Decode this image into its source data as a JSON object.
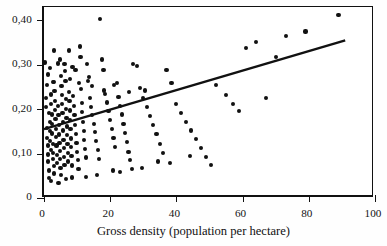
{
  "chart_data": {
    "type": "scatter",
    "title": "",
    "xlabel": "Gross density (population per hectare)",
    "ylabel": "",
    "xlim": [
      0,
      100
    ],
    "ylim": [
      0,
      0.43
    ],
    "grid": false,
    "legend": null,
    "decimal_separator": ",",
    "xticks": [
      0,
      20,
      40,
      60,
      80,
      100
    ],
    "xticklabels": [
      "0",
      "20",
      "40",
      "60",
      "80",
      "100"
    ],
    "yticks": [
      0,
      0.1,
      0.2,
      0.3,
      0.4
    ],
    "yticklabels": [
      "0",
      "0,10",
      "0,20",
      "0,30",
      "0,40"
    ],
    "series": [
      {
        "name": "cities",
        "marker": "filled-circle",
        "color": "#111111",
        "points": [
          [
            0.6,
            0.225
          ],
          [
            0.7,
            0.205
          ],
          [
            0.8,
            0.255
          ],
          [
            0.9,
            0.158
          ],
          [
            1.0,
            0.135
          ],
          [
            1.1,
            0.118
          ],
          [
            1.2,
            0.098
          ],
          [
            1.3,
            0.082
          ],
          [
            1.4,
            0.062
          ],
          [
            1.5,
            0.045
          ],
          [
            1.6,
            0.192
          ],
          [
            1.7,
            0.172
          ],
          [
            1.8,
            0.151
          ],
          [
            1.9,
            0.128
          ],
          [
            2.0,
            0.108
          ],
          [
            2.1,
            0.233
          ],
          [
            2.2,
            0.212
          ],
          [
            2.3,
            0.188
          ],
          [
            2.4,
            0.166
          ],
          [
            2.5,
            0.145
          ],
          [
            2.6,
            0.122
          ],
          [
            2.7,
            0.101
          ],
          [
            2.8,
            0.088
          ],
          [
            2.9,
            0.072
          ],
          [
            3.0,
            0.055
          ],
          [
            3.1,
            0.262
          ],
          [
            3.2,
            0.241
          ],
          [
            3.3,
            0.219
          ],
          [
            3.4,
            0.198
          ],
          [
            3.5,
            0.177
          ],
          [
            3.6,
            0.156
          ],
          [
            3.7,
            0.138
          ],
          [
            3.8,
            0.118
          ],
          [
            3.9,
            0.097
          ],
          [
            4.0,
            0.079
          ],
          [
            4.2,
            0.303
          ],
          [
            4.3,
            0.208
          ],
          [
            4.4,
            0.186
          ],
          [
            4.5,
            0.164
          ],
          [
            4.6,
            0.143
          ],
          [
            4.7,
            0.124
          ],
          [
            4.8,
            0.106
          ],
          [
            4.9,
            0.088
          ],
          [
            5.0,
            0.068
          ],
          [
            5.1,
            0.052
          ],
          [
            5.3,
            0.252
          ],
          [
            5.4,
            0.231
          ],
          [
            5.5,
            0.211
          ],
          [
            5.6,
            0.192
          ],
          [
            5.7,
            0.172
          ],
          [
            5.8,
            0.152
          ],
          [
            5.9,
            0.131
          ],
          [
            6.0,
            0.112
          ],
          [
            6.1,
            0.093
          ],
          [
            6.2,
            0.075
          ],
          [
            6.4,
            0.286
          ],
          [
            6.5,
            0.264
          ],
          [
            6.6,
            0.223
          ],
          [
            6.7,
            0.201
          ],
          [
            6.8,
            0.181
          ],
          [
            6.9,
            0.161
          ],
          [
            7.0,
            0.142
          ],
          [
            7.1,
            0.122
          ],
          [
            7.2,
            0.101
          ],
          [
            7.3,
            0.082
          ],
          [
            7.5,
            0.332
          ],
          [
            7.6,
            0.239
          ],
          [
            7.7,
            0.218
          ],
          [
            7.8,
            0.197
          ],
          [
            7.9,
            0.176
          ],
          [
            8.0,
            0.155
          ],
          [
            8.1,
            0.134
          ],
          [
            8.2,
            0.115
          ],
          [
            8.3,
            0.095
          ],
          [
            8.4,
            0.073
          ],
          [
            8.6,
            0.295
          ],
          [
            8.8,
            0.229
          ],
          [
            9.0,
            0.208
          ],
          [
            9.2,
            0.187
          ],
          [
            9.4,
            0.165
          ],
          [
            9.6,
            0.144
          ],
          [
            9.8,
            0.124
          ],
          [
            10.0,
            0.104
          ],
          [
            10.2,
            0.086
          ],
          [
            10.4,
            0.066
          ],
          [
            10.8,
            0.341
          ],
          [
            11.0,
            0.318
          ],
          [
            11.2,
            0.246
          ],
          [
            11.4,
            0.214
          ],
          [
            11.6,
            0.193
          ],
          [
            11.8,
            0.172
          ],
          [
            12.0,
            0.151
          ],
          [
            12.2,
            0.131
          ],
          [
            12.4,
            0.111
          ],
          [
            12.6,
            0.091
          ],
          [
            13.0,
            0.302
          ],
          [
            13.4,
            0.263
          ],
          [
            13.8,
            0.225
          ],
          [
            14.2,
            0.205
          ],
          [
            14.6,
            0.186
          ],
          [
            15.0,
            0.166
          ],
          [
            15.4,
            0.148
          ],
          [
            15.8,
            0.128
          ],
          [
            16.2,
            0.108
          ],
          [
            16.6,
            0.088
          ],
          [
            17.0,
            0.403
          ],
          [
            17.5,
            0.312
          ],
          [
            18.0,
            0.289
          ],
          [
            18.5,
            0.235
          ],
          [
            19.0,
            0.215
          ],
          [
            19.5,
            0.195
          ],
          [
            20.0,
            0.176
          ],
          [
            20.5,
            0.155
          ],
          [
            21.0,
            0.135
          ],
          [
            21.5,
            0.114
          ],
          [
            22.0,
            0.258
          ],
          [
            22.5,
            0.228
          ],
          [
            23.0,
            0.208
          ],
          [
            23.5,
            0.188
          ],
          [
            24.0,
            0.167
          ],
          [
            24.5,
            0.146
          ],
          [
            25.0,
            0.126
          ],
          [
            25.5,
            0.104
          ],
          [
            26.0,
            0.086
          ],
          [
            26.5,
            0.066
          ],
          [
            27.0,
            0.302
          ],
          [
            28.0,
            0.297
          ],
          [
            29.0,
            0.248
          ],
          [
            30.0,
            0.225
          ],
          [
            31.0,
            0.205
          ],
          [
            32.0,
            0.185
          ],
          [
            33.0,
            0.164
          ],
          [
            34.0,
            0.144
          ],
          [
            35.0,
            0.122
          ],
          [
            36.0,
            0.102
          ],
          [
            37.0,
            0.288
          ],
          [
            38.5,
            0.258
          ],
          [
            40.0,
            0.212
          ],
          [
            41.5,
            0.192
          ],
          [
            43.0,
            0.172
          ],
          [
            44.5,
            0.152
          ],
          [
            46.0,
            0.132
          ],
          [
            47.5,
            0.112
          ],
          [
            49.0,
            0.092
          ],
          [
            50.5,
            0.075
          ],
          [
            52.0,
            0.255
          ],
          [
            55.0,
            0.232
          ],
          [
            57.0,
            0.212
          ],
          [
            59.0,
            0.195
          ],
          [
            61.0,
            0.337
          ],
          [
            64.0,
            0.352
          ],
          [
            67.0,
            0.225
          ],
          [
            70.0,
            0.318
          ],
          [
            73.0,
            0.365
          ],
          [
            79.0,
            0.375
          ],
          [
            89.0,
            0.412
          ],
          [
            8.5,
            0.046
          ],
          [
            12.8,
            0.048
          ],
          [
            16.0,
            0.052
          ],
          [
            20.8,
            0.062
          ],
          [
            23.0,
            0.058
          ],
          [
            29.5,
            0.068
          ],
          [
            34.5,
            0.082
          ],
          [
            38.0,
            0.078
          ],
          [
            44.0,
            0.095
          ],
          [
            2.2,
            0.038
          ],
          [
            4.4,
            0.033
          ],
          [
            6.6,
            0.042
          ],
          [
            0.4,
            0.305
          ],
          [
            1.2,
            0.278
          ],
          [
            1.9,
            0.292
          ],
          [
            3.1,
            0.332
          ],
          [
            4.8,
            0.312
          ],
          [
            6.2,
            0.301
          ],
          [
            9.5,
            0.288
          ],
          [
            13.5,
            0.272
          ],
          [
            2.8,
            0.262
          ],
          [
            5.2,
            0.275
          ],
          [
            7.8,
            0.268
          ],
          [
            10.5,
            0.258
          ],
          [
            14.5,
            0.252
          ],
          [
            18.2,
            0.242
          ],
          [
            21.2,
            0.255
          ],
          [
            25.8,
            0.238
          ],
          [
            30.5,
            0.242
          ]
        ]
      }
    ],
    "trendline": {
      "type": "linear",
      "x_start": 0,
      "y_start": 0.155,
      "x_end": 91,
      "y_end": 0.355,
      "color": "#111111",
      "width": 2.4
    }
  },
  "axes": {
    "x_title": "Gross density (population per hectare)",
    "x_tick_labels": [
      "0",
      "20",
      "40",
      "60",
      "80",
      "100"
    ],
    "y_tick_labels": [
      "0",
      "0,10",
      "0,20",
      "0,30",
      "0,40"
    ]
  }
}
